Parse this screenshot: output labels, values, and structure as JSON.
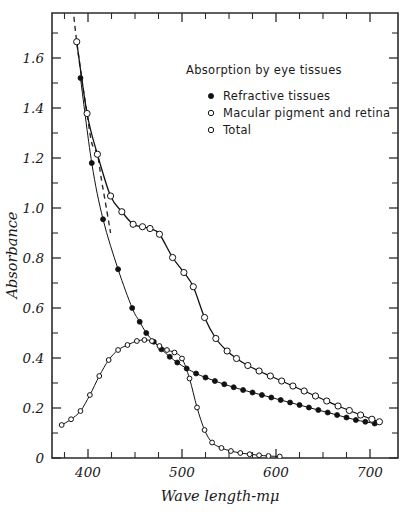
{
  "chart_data": {
    "type": "line",
    "title": "Absorption by eye tissues",
    "xlabel": "Wave length-mμ",
    "ylabel": "Absorbance",
    "xlim": [
      370,
      715
    ],
    "ylim": [
      0,
      1.78
    ],
    "xticks_major": [
      400,
      500,
      600,
      700
    ],
    "xticks_minor": [
      375,
      425,
      450,
      475,
      525,
      550,
      575,
      625,
      650,
      675
    ],
    "xtick_labels": [
      "400",
      "500",
      "600",
      "700"
    ],
    "yticks_major": [
      0,
      0.2,
      0.4,
      0.6,
      0.8,
      1.0,
      1.2,
      1.4,
      1.6
    ],
    "ytick_labels": [
      "0",
      "0.2",
      "0.4",
      "0.6",
      "0.8",
      "1.0",
      "1.2",
      "1.4",
      "1.6"
    ],
    "yticks_minor": [
      0.1,
      0.3,
      0.5,
      0.7,
      0.9,
      1.1,
      1.3,
      1.5,
      1.7
    ],
    "grid": false,
    "legend_position": "upper-right-inside",
    "series": [
      {
        "name": "Refractive tissues",
        "marker": "filled-circle",
        "line": "solid-thin",
        "points": [
          [
            392,
            1.52
          ],
          [
            404,
            1.18
          ],
          [
            416,
            0.955
          ],
          [
            432,
            0.755
          ],
          [
            447,
            0.6
          ],
          [
            455,
            0.545
          ],
          [
            462,
            0.5
          ],
          [
            470,
            0.465
          ],
          [
            478,
            0.435
          ],
          [
            487,
            0.405
          ],
          [
            495,
            0.382
          ],
          [
            505,
            0.358
          ],
          [
            515,
            0.338
          ],
          [
            525,
            0.322
          ],
          [
            535,
            0.308
          ],
          [
            545,
            0.295
          ],
          [
            555,
            0.283
          ],
          [
            565,
            0.272
          ],
          [
            575,
            0.262
          ],
          [
            585,
            0.252
          ],
          [
            595,
            0.242
          ],
          [
            605,
            0.232
          ],
          [
            615,
            0.222
          ],
          [
            625,
            0.212
          ],
          [
            635,
            0.202
          ],
          [
            645,
            0.192
          ],
          [
            655,
            0.182
          ],
          [
            665,
            0.172
          ],
          [
            675,
            0.162
          ],
          [
            685,
            0.152
          ],
          [
            695,
            0.145
          ],
          [
            705,
            0.138
          ]
        ]
      },
      {
        "name": "Macular pigment and retina",
        "marker": "open-circle",
        "line": "solid-thin",
        "points": [
          [
            372,
            0.132
          ],
          [
            382,
            0.155
          ],
          [
            392,
            0.188
          ],
          [
            402,
            0.252
          ],
          [
            412,
            0.328
          ],
          [
            422,
            0.392
          ],
          [
            432,
            0.432
          ],
          [
            442,
            0.452
          ],
          [
            452,
            0.468
          ],
          [
            460,
            0.472
          ],
          [
            468,
            0.468
          ],
          [
            476,
            0.448
          ],
          [
            484,
            0.432
          ],
          [
            492,
            0.422
          ],
          [
            500,
            0.398
          ],
          [
            508,
            0.318
          ],
          [
            516,
            0.202
          ],
          [
            524,
            0.112
          ],
          [
            532,
            0.062
          ],
          [
            542,
            0.04
          ],
          [
            552,
            0.028
          ],
          [
            562,
            0.02
          ],
          [
            572,
            0.015
          ],
          [
            582,
            0.011
          ],
          [
            592,
            0.008
          ],
          [
            604,
            0.006
          ]
        ]
      },
      {
        "name": "Total",
        "marker": "open-circle",
        "line": "solid-thick-with-dashed-extension",
        "points": [
          [
            388,
            1.665
          ],
          [
            399,
            1.378
          ],
          [
            410,
            1.215
          ],
          [
            424,
            1.048
          ],
          [
            436,
            0.985
          ],
          [
            448,
            0.935
          ],
          [
            458,
            0.925
          ],
          [
            466,
            0.918
          ],
          [
            476,
            0.895
          ],
          [
            490,
            0.802
          ],
          [
            502,
            0.742
          ],
          [
            512,
            0.685
          ],
          [
            524,
            0.562
          ],
          [
            536,
            0.478
          ],
          [
            548,
            0.428
          ],
          [
            558,
            0.398
          ],
          [
            570,
            0.37
          ],
          [
            582,
            0.348
          ],
          [
            594,
            0.328
          ],
          [
            606,
            0.308
          ],
          [
            618,
            0.288
          ],
          [
            630,
            0.268
          ],
          [
            642,
            0.248
          ],
          [
            654,
            0.228
          ],
          [
            666,
            0.208
          ],
          [
            678,
            0.19
          ],
          [
            690,
            0.172
          ],
          [
            702,
            0.155
          ],
          [
            710,
            0.145
          ]
        ],
        "dashed_segment": [
          [
            384,
            1.8
          ],
          [
            388,
            1.665
          ],
          [
            394,
            1.5
          ],
          [
            399,
            1.378
          ],
          [
            404,
            1.26
          ],
          [
            410,
            1.215
          ],
          [
            414,
            1.12
          ],
          [
            420,
            0.99
          ],
          [
            424,
            0.9
          ]
        ]
      }
    ],
    "legend_entries": [
      {
        "marker": "filled-circle",
        "label": "Refractive tissues"
      },
      {
        "marker": "open-circle",
        "label": "Macular pigment and retina"
      },
      {
        "marker": "open-circle",
        "label": "Total"
      }
    ]
  },
  "colors": {
    "ink": "#111111",
    "axis": "#2b2b2b",
    "background": "#ffffff"
  }
}
